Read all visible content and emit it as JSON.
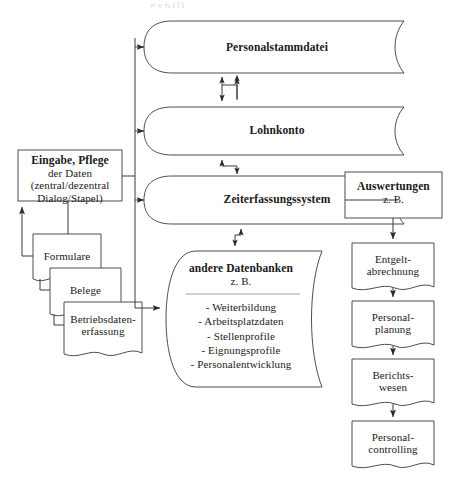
{
  "diagram": {
    "title_cut_fragment": "g y p (1)",
    "input_box": {
      "line1": "Eingabe, Pflege",
      "line2": "der Daten",
      "line3": "(zentral/dezentral",
      "line4": "Dialog/Stapel)"
    },
    "source_documents": [
      {
        "label": "Formulare"
      },
      {
        "label": "Belege"
      },
      {
        "label_line1": "Betriebsdaten-",
        "label_line2": "erfassung"
      }
    ],
    "databases": [
      {
        "label": "Personalstammdatei"
      },
      {
        "label": "Lohnkonto"
      },
      {
        "label": "Zeiterfassungssystem"
      }
    ],
    "other_databases": {
      "title": "andere Datenbanken",
      "subtitle": "z. B.",
      "items": [
        "- Weiterbildung",
        "- Arbeitsplatzdaten",
        "- Stellenprofile",
        "- Eignungsprofile",
        "- Personalentwicklung"
      ]
    },
    "evaluations_box": {
      "line1": "Auswertungen",
      "line2": "z. B."
    },
    "outputs": [
      {
        "label_line1": "Entgelt-",
        "label_line2": "abrechnung"
      },
      {
        "label_line1": "Personal-",
        "label_line2": "planung"
      },
      {
        "label_line1": "Berichts-",
        "label_line2": "wesen"
      },
      {
        "label_line1": "Personal-",
        "label_line2": "controlling"
      }
    ],
    "colors": {
      "stroke": "#3a3a3a",
      "text": "#1a1a1a",
      "background": "#ffffff"
    }
  }
}
